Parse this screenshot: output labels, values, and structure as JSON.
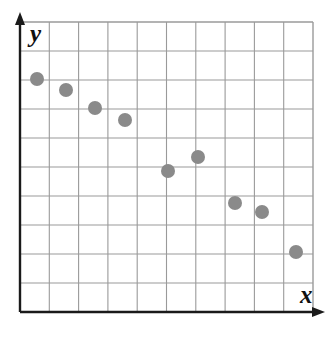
{
  "figure": {
    "name": "scatter-plot-negative-correlation",
    "background_color": "#ffffff"
  },
  "axes": {
    "x_label": "x",
    "y_label": "y",
    "axis_color": "#1a1a1a",
    "arrow_x_name": "x-axis-arrow",
    "arrow_y_name": "y-axis-arrow"
  },
  "grid": {
    "color": "#9a9a9a",
    "columns": 10,
    "rows": 10,
    "left": 20,
    "top": 22,
    "right": 313,
    "bottom": 312,
    "cell_width": 29.3,
    "cell_height": 29.0,
    "show": true
  },
  "markers": {
    "color": "#8a8a8a",
    "radius": 7,
    "shape": "circle"
  },
  "chart_data": {
    "type": "scatter",
    "title": "",
    "subtitle": "",
    "xlabel": "x",
    "ylabel": "y",
    "grid": true,
    "legend": null,
    "xlim": [
      0,
      10
    ],
    "ylim": [
      0,
      10
    ],
    "xticklabels": [],
    "yticklabels": [],
    "annotations": [],
    "series": [
      {
        "name": "data",
        "color": "#8a8a8a",
        "x": [
          1,
          2,
          3,
          4,
          6,
          7,
          8,
          9,
          10
        ],
        "y": [
          8,
          7.6,
          6.9,
          6.5,
          5,
          5.4,
          3.9,
          3.5,
          2.1
        ],
        "px": [
          37,
          66,
          95,
          125,
          168,
          198,
          235,
          262,
          296
        ],
        "py": [
          79,
          90,
          108,
          120,
          171,
          157,
          203,
          212,
          252
        ]
      }
    ]
  }
}
